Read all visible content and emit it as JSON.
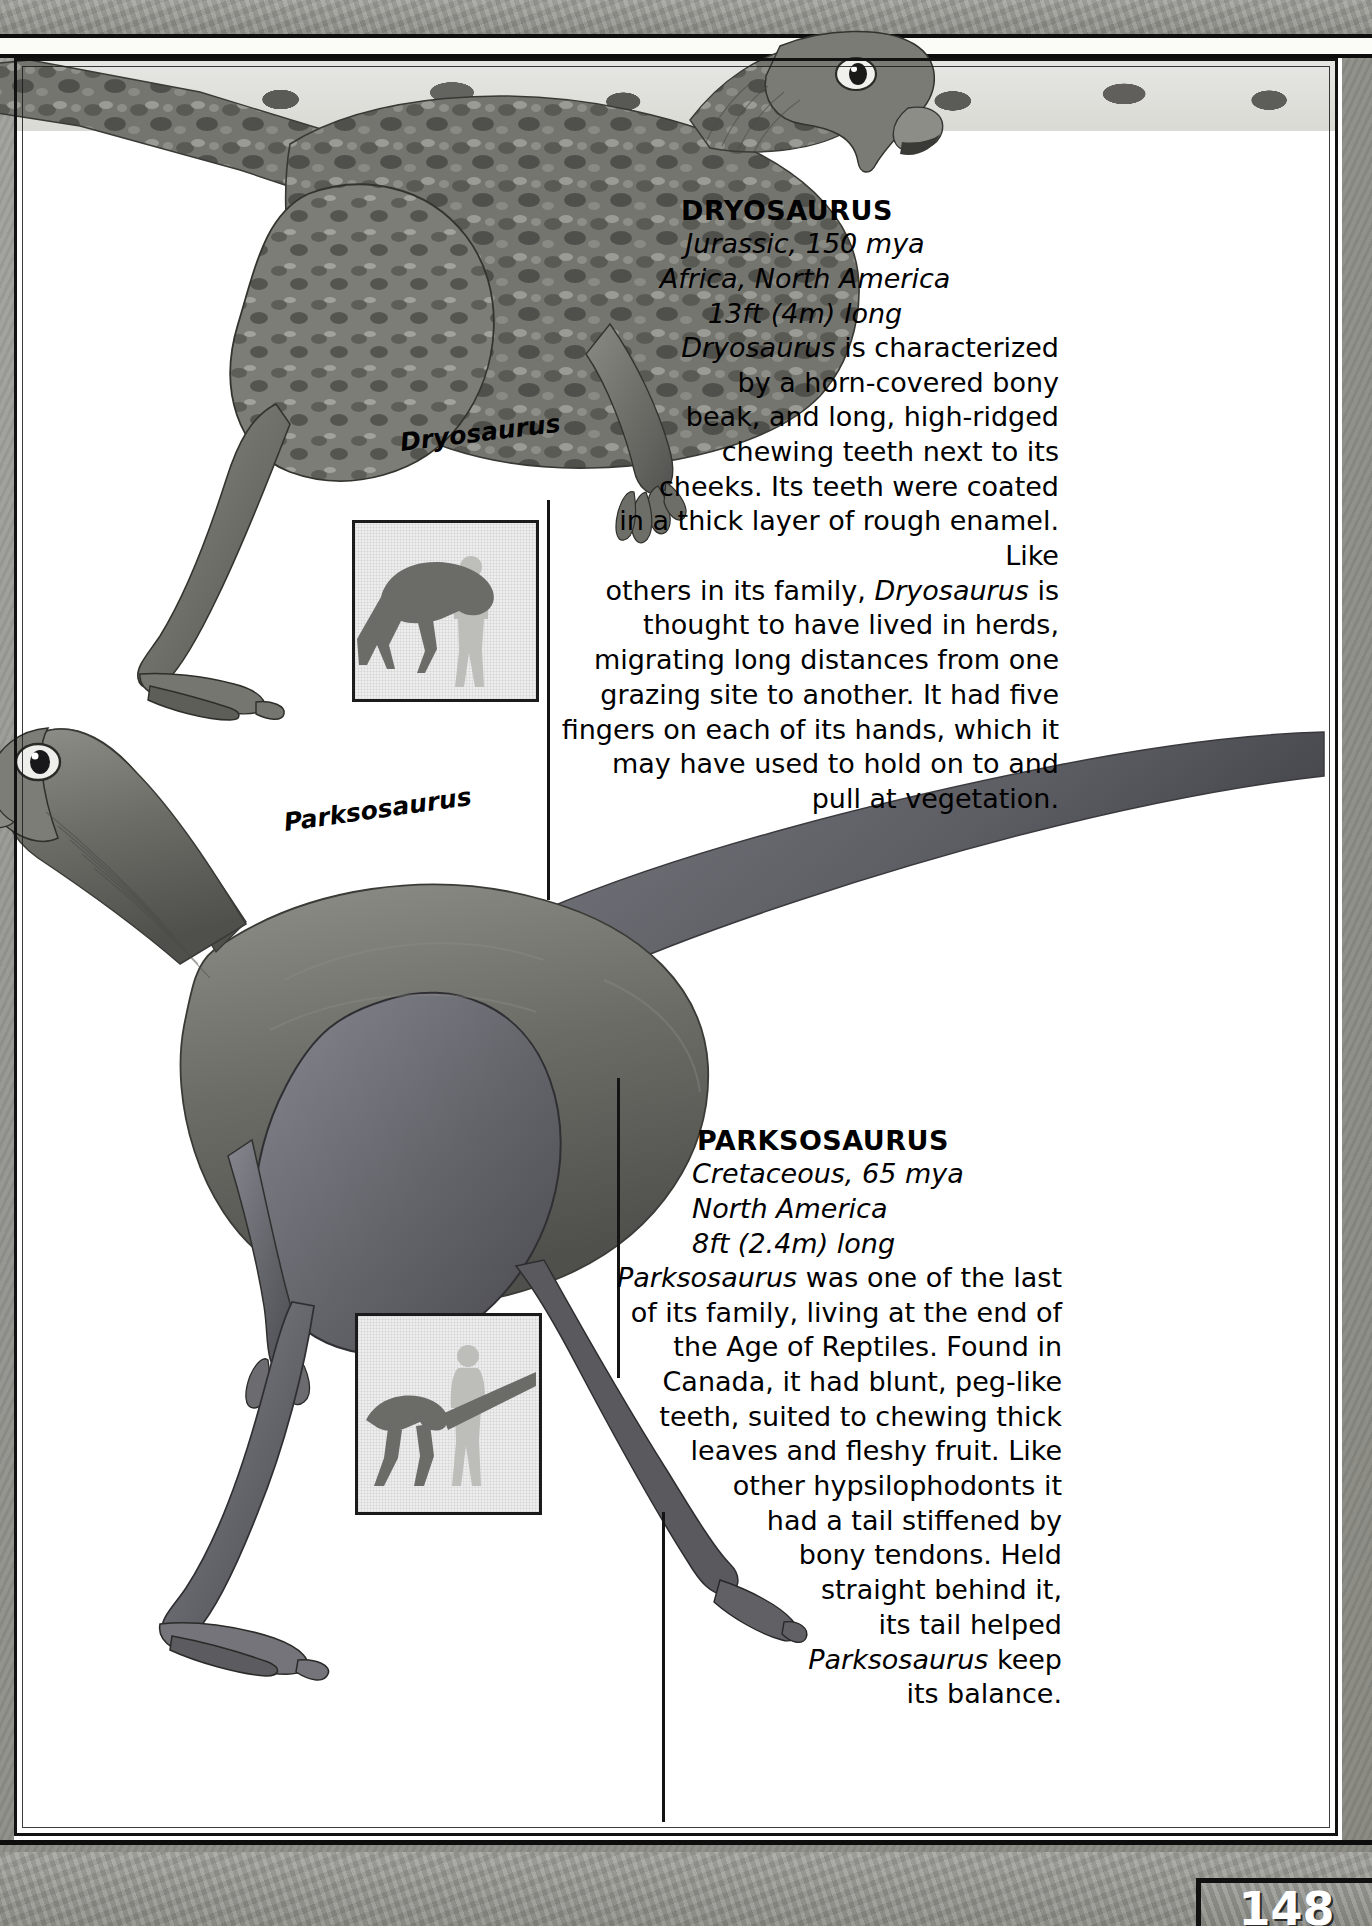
{
  "page": {
    "page_number": "148"
  },
  "entries": [
    {
      "id": "dryosaurus",
      "name": "DRYOSAURUS",
      "period": "Jurassic, 150 mya",
      "region": "Africa, North America",
      "size": "13ft (4m) long",
      "caption": "Dryosaurus",
      "body_lines": [
        "Dryosaurus is characterized",
        "by a horn-covered bony",
        "beak, and long, high-ridged",
        "chewing teeth next to its",
        "cheeks. Its teeth were coated",
        "in a thick layer of rough enamel. Like",
        "others in its family, Dryosaurus is",
        "thought to have lived in herds,",
        "migrating long distances from one",
        "grazing site to another. It had five",
        "fingers on each of its hands, which it",
        "may have used to hold on to and",
        "pull at vegetation."
      ],
      "body_text": "Dryosaurus is characterized by a horn-covered bony beak, and long, high-ridged chewing teeth next to its cheeks. Its teeth were coated in a thick layer of rough enamel. Like others in its family, Dryosaurus is thought to have lived in herds, migrating long distances from one grazing site to another. It had five fingers on each of its hands, which it may have used to hold on to and pull at vegetation."
    },
    {
      "id": "parksosaurus",
      "name": "PARKSOSAURUS",
      "period": "Cretaceous, 65 mya",
      "region": "North America",
      "size": "8ft (2.4m) long",
      "caption": "Parksosaurus",
      "body_lines": [
        "Parksosaurus was one of the last",
        "of its family, living at the end of",
        "the Age of Reptiles. Found in",
        "Canada, it had blunt, peg-like",
        "teeth, suited to chewing thick",
        "leaves and fleshy fruit. Like",
        "other hypsilophodonts it",
        "had a tail stiffened by",
        "bony tendons. Held",
        "straight behind it,",
        "its tail helped",
        "Parksosaurus keep",
        "its balance."
      ],
      "body_text": "Parksosaurus was one of the last of its family, living at the end of the Age of Reptiles. Found in Canada, it had blunt, peg-like teeth, suited to chewing thick leaves and fleshy fruit. Like other hypsilophodonts it had a tail stiffened by bony tendons. Held straight behind it, its tail helped Parksosaurus keep its balance."
    }
  ],
  "colors": {
    "page_background": "#8d8d8d",
    "card_background": "#ffffff",
    "ink": "#000000",
    "scale_box_fill": "#ededed",
    "silhouette_dark": "#6b6b68",
    "silhouette_light": "#bdbdba"
  }
}
